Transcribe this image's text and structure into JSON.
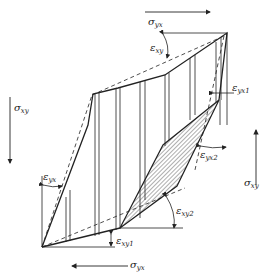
{
  "diagram": {
    "labels": {
      "sigma_yx_top": {
        "sym": "σ",
        "sub": "yx"
      },
      "sigma_yx_bottom": {
        "sym": "σ",
        "sub": "yx"
      },
      "sigma_xy_left": {
        "sym": "σ",
        "sub": "xy"
      },
      "sigma_xy_right": {
        "sym": "σ",
        "sub": "xy"
      },
      "eps_xy": {
        "sym": "ε",
        "sub": "xy"
      },
      "eps_yx": {
        "sym": "ε",
        "sub": "yx"
      },
      "eps_yx1": {
        "sym": "ε",
        "sub": "yx1"
      },
      "eps_yx2": {
        "sym": "ε",
        "sub": "yx2"
      },
      "eps_xy1": {
        "sym": "ε",
        "sub": "xy1"
      },
      "eps_xy2": {
        "sym": "ε",
        "sub": "xy2"
      }
    },
    "colors": {
      "line": "#222222",
      "hatch": "#333333",
      "background": "#ffffff"
    }
  }
}
